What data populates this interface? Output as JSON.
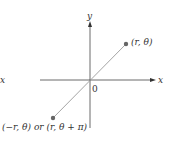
{
  "diagram": {
    "axes": {
      "x_label": "x",
      "y_label": "y",
      "origin_label": "0"
    },
    "points": [
      {
        "label": "(r, θ)",
        "description": "point at distance r, angle θ (first quadrant)"
      },
      {
        "label": "(−r, θ) or (r, θ + π)",
        "description": "opposite point through origin (third quadrant)"
      }
    ],
    "edge_fragment_label": "x",
    "colors": {
      "axis": "#444444",
      "ray": "#9a9a9a",
      "point": "#666666",
      "text": "#333333"
    }
  }
}
